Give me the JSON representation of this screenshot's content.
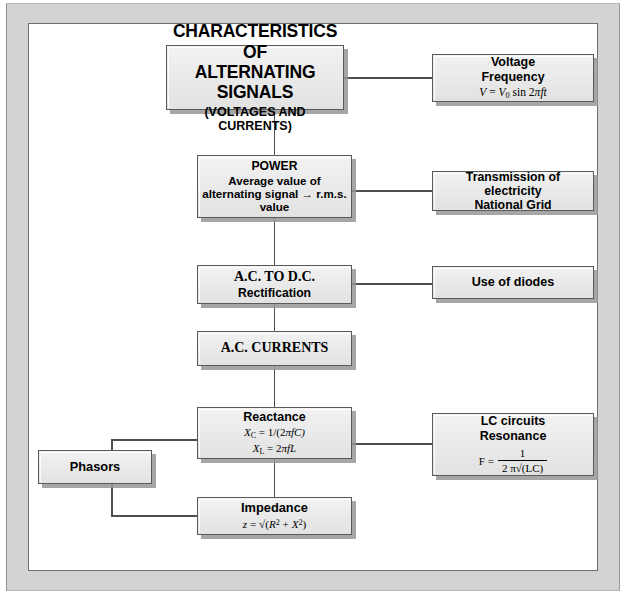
{
  "diagram": {
    "frame_color": "#d3d3d3",
    "node_fill": "#eaeaea",
    "node_border": "#5a5a5a",
    "line_color": "#4f4f4f",
    "nodes": {
      "characteristics": {
        "line1": "CHARACTERISTICS OF",
        "line2": "ALTERNATING SIGNALS",
        "line3": "(VOLTAGES AND CURRENTS)"
      },
      "voltage_frequency": {
        "line1": "Voltage",
        "line2": "Frequency",
        "formula_v": "V",
        "formula_eq": " = ",
        "formula_v0": "V",
        "formula_v0_sub": "0",
        "formula_rest": " sin 2",
        "formula_pi": "π",
        "formula_ft": "ft"
      },
      "power": {
        "line1": "POWER",
        "line2": "Average value of",
        "line3": "alternating signal → r.m.s.",
        "line4": "value"
      },
      "transmission": {
        "line1": "Transmission of electricity",
        "line2": "National Grid"
      },
      "ac_to_dc": {
        "line1": "A.C. TO D.C.",
        "line2": "Rectification"
      },
      "diodes": {
        "line1": "Use of diodes"
      },
      "ac_currents": {
        "line1": "A.C. CURRENTS"
      },
      "reactance": {
        "line1": "Reactance",
        "xc_symbol": "X",
        "xc_sub": "C",
        "xc_value": " = 1/(2",
        "xc_pi": "π",
        "xc_tail": "fC)",
        "xl_symbol": "X",
        "xl_sub": "L",
        "xl_value": " = 2",
        "xl_pi": "π",
        "xl_tail": "fL"
      },
      "lc_circuits": {
        "line1": "LC circuits",
        "line2": "Resonance",
        "f_label": "F  =",
        "numerator": "1",
        "denominator_pre": "2 ",
        "denominator_pi": "π",
        "denominator_post": "√(LC)"
      },
      "phasors": {
        "line1": "Phasors"
      },
      "impedance": {
        "line1": "Impedance",
        "z_symbol": "z",
        "z_eq": " = √(",
        "z_r": "R",
        "z_r_sup": "2",
        "z_plus": " + ",
        "z_x": "X",
        "z_x_sup": "2",
        "z_close": ")"
      }
    },
    "connections": [
      {
        "from": "characteristics",
        "to": "voltage_frequency",
        "kind": "horizontal"
      },
      {
        "from": "characteristics",
        "to": "power",
        "kind": "vertical"
      },
      {
        "from": "power",
        "to": "transmission",
        "kind": "horizontal"
      },
      {
        "from": "power",
        "to": "ac_to_dc",
        "kind": "vertical"
      },
      {
        "from": "ac_to_dc",
        "to": "diodes",
        "kind": "horizontal"
      },
      {
        "from": "ac_to_dc",
        "to": "ac_currents",
        "kind": "vertical"
      },
      {
        "from": "ac_currents",
        "to": "reactance",
        "kind": "vertical"
      },
      {
        "from": "reactance",
        "to": "lc_circuits",
        "kind": "horizontal"
      },
      {
        "from": "reactance",
        "to": "phasors",
        "kind": "elbow-left"
      },
      {
        "from": "reactance",
        "to": "impedance",
        "kind": "vertical"
      },
      {
        "from": "phasors",
        "to": "impedance",
        "kind": "elbow-left"
      }
    ]
  }
}
